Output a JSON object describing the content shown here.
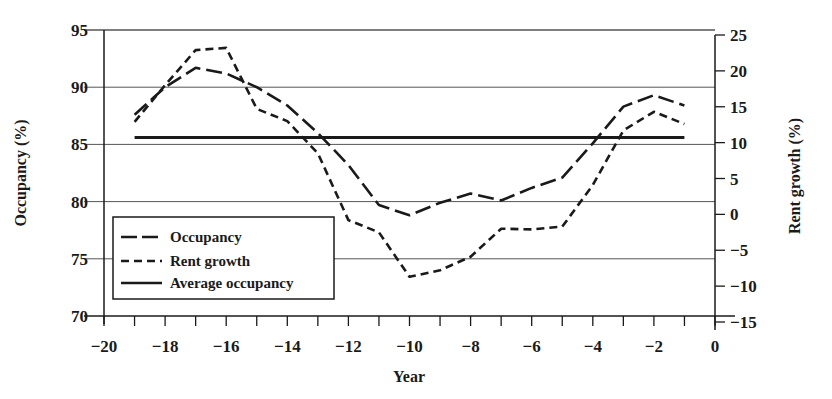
{
  "chart_data": {
    "type": "line",
    "title": "",
    "xlabel": "Year",
    "ylabel": "Occupancy (%)",
    "y2label": "Rent growth (%)",
    "xlim": [
      -20,
      0
    ],
    "ylim": [
      70,
      95
    ],
    "y2lim": [
      -15,
      25
    ],
    "x_ticks": [
      -20,
      -18,
      -16,
      -14,
      -12,
      -10,
      -8,
      -6,
      -4,
      -2,
      0
    ],
    "x_tick_labels": [
      "−20",
      "−18",
      "−16",
      "−14",
      "−12",
      "−10",
      "−8",
      "−6",
      "−4",
      "−2",
      "0"
    ],
    "y_ticks": [
      70,
      75,
      80,
      85,
      90,
      95
    ],
    "y_tick_labels": [
      "70",
      "75",
      "80",
      "85",
      "90",
      "95"
    ],
    "y2_ticks": [
      -15,
      -10,
      -5,
      0,
      5,
      10,
      15,
      20,
      25
    ],
    "y2_tick_labels": [
      "−15",
      "−10",
      "−5",
      "0",
      "5",
      "10",
      "15",
      "20",
      "25"
    ],
    "grid": "horizontal lines at left-axis ticks",
    "legend_position": "lower left",
    "x": [
      -19,
      -18,
      -17,
      -16,
      -15,
      -14,
      -13,
      -12,
      -11,
      -10,
      -9,
      -8,
      -7,
      -6,
      -5,
      -4,
      -3,
      -2,
      -1
    ],
    "series": [
      {
        "name": "Occupancy",
        "axis": "left",
        "style": "long-dash",
        "values": [
          87.6,
          90.0,
          91.7,
          91.2,
          90.0,
          88.4,
          86.0,
          83.2,
          79.7,
          78.8,
          79.9,
          80.7,
          80.1,
          81.2,
          82.1,
          85.1,
          88.3,
          89.3,
          88.4
        ]
      },
      {
        "name": "Rent growth",
        "axis": "right",
        "style": "short-dash",
        "values": [
          12.9,
          18.0,
          22.9,
          23.2,
          14.7,
          13.0,
          8.5,
          -0.8,
          -2.5,
          -8.7,
          -7.8,
          -5.9,
          -2.0,
          -2.1,
          -1.7,
          4.1,
          11.7,
          14.3,
          12.6
        ]
      },
      {
        "name": "Average occupancy",
        "axis": "left",
        "style": "solid",
        "values": [
          85.6,
          85.6,
          85.6,
          85.6,
          85.6,
          85.6,
          85.6,
          85.6,
          85.6,
          85.6,
          85.6,
          85.6,
          85.6,
          85.6,
          85.6,
          85.6,
          85.6,
          85.6,
          85.6
        ]
      }
    ]
  },
  "legend": {
    "items": [
      {
        "label": "Occupancy",
        "style": "long-dash"
      },
      {
        "label": "Rent growth",
        "style": "short-dash"
      },
      {
        "label": "Average occupancy",
        "style": "solid"
      }
    ]
  },
  "colors": {
    "ink": "#1a1a1a",
    "grid": "#555555",
    "background": "#ffffff"
  }
}
